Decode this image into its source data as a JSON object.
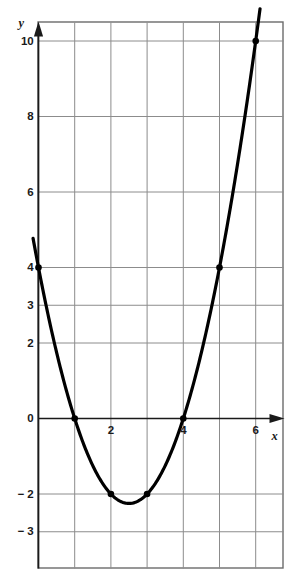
{
  "chart_data": {
    "type": "line",
    "title": "",
    "subtitle": "",
    "xlabel": "x",
    "ylabel": "y",
    "xlim": [
      -0.9,
      6.8
    ],
    "ylim": [
      -3.9,
      10.6
    ],
    "grid": true,
    "legend": null,
    "x_ticks": [
      {
        "value": 2,
        "label": "2"
      },
      {
        "value": 4,
        "label": "4"
      },
      {
        "value": 6,
        "label": "6"
      }
    ],
    "y_ticks": [
      {
        "value": 10,
        "label": "10"
      },
      {
        "value": 8,
        "label": "8"
      },
      {
        "value": 6,
        "label": "6"
      },
      {
        "value": 4,
        "label": "4"
      },
      {
        "value": 3,
        "label": "3"
      },
      {
        "value": 2,
        "label": "2"
      },
      {
        "value": 0,
        "label": "0"
      },
      {
        "value": -2,
        "label": "− 2"
      },
      {
        "value": -3,
        "label": "− 3"
      }
    ],
    "x_gridlines": [
      0,
      1,
      2,
      3,
      4,
      5,
      6
    ],
    "y_gridlines": [
      10,
      8,
      6,
      4,
      3,
      2,
      0,
      -2,
      -3
    ],
    "equation": "y = x² − 5x + 4",
    "vertex": {
      "x": 2.5,
      "y": -2.25
    },
    "roots": [
      1,
      4
    ],
    "series": [
      {
        "name": "y = x² − 5x + 4",
        "type": "parabola",
        "color": "#000000",
        "line_width": 3.2,
        "x_domain": [
          -0.15,
          6.12
        ],
        "marked_points": [
          {
            "x": 0,
            "y": 4
          },
          {
            "x": 1,
            "y": 0
          },
          {
            "x": 2,
            "y": -2
          },
          {
            "x": 3,
            "y": -2
          },
          {
            "x": 4,
            "y": 0
          },
          {
            "x": 5,
            "y": 4
          },
          {
            "x": 6,
            "y": 10
          }
        ]
      }
    ],
    "colors": {
      "curve": "#000000",
      "gridline": "#8c8c8c",
      "axis": "#1a1a1a",
      "border": "#6b6b6b",
      "background": "#ffffff",
      "point": "#000000"
    }
  }
}
